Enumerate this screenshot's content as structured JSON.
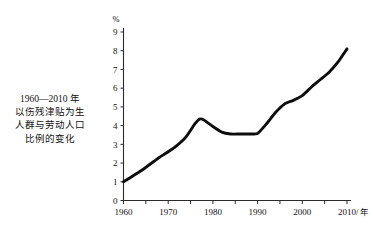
{
  "caption": {
    "lines": [
      "1960—2010 年",
      "以伤残津贴为生",
      "人群与劳动人口",
      "比例的变化"
    ]
  },
  "axes": {
    "y_unit": "%",
    "x_unit": "/ 年",
    "y_ticks": [
      "0",
      "1",
      "2",
      "3",
      "4",
      "5",
      "6",
      "7",
      "8",
      "9"
    ],
    "x_ticks": [
      "1960",
      "1970",
      "1980",
      "1990",
      "2000",
      "2010"
    ]
  },
  "chart_data": {
    "type": "line",
    "xlabel": "/ 年",
    "ylabel": "%",
    "xlim": [
      1960,
      2010
    ],
    "ylim": [
      0,
      9
    ],
    "grid": false,
    "legend": "none",
    "x_tick_values": [
      1960,
      1970,
      1980,
      1990,
      2000,
      2010
    ],
    "x_minor_tick_step": 5,
    "y_tick_values": [
      0,
      1,
      2,
      3,
      4,
      5,
      6,
      7,
      8,
      9
    ],
    "series": [
      {
        "name": "以伤残津贴为生人群占劳动人口比例",
        "color": "#0d0d0d",
        "x": [
          1960,
          1962,
          1964,
          1966,
          1968,
          1970,
          1972,
          1974,
          1976,
          1977,
          1978,
          1980,
          1982,
          1984,
          1986,
          1988,
          1990,
          1992,
          1994,
          1996,
          1998,
          2000,
          2002,
          2004,
          2006,
          2008,
          2010
        ],
        "values": [
          1.0,
          1.3,
          1.6,
          1.95,
          2.3,
          2.6,
          2.95,
          3.4,
          4.1,
          4.35,
          4.3,
          3.95,
          3.65,
          3.55,
          3.55,
          3.55,
          3.58,
          4.1,
          4.7,
          5.15,
          5.35,
          5.6,
          6.05,
          6.45,
          6.85,
          7.4,
          8.1
        ]
      }
    ],
    "annotations": []
  }
}
